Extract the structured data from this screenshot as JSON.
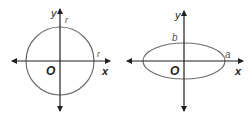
{
  "diagrams": [
    {
      "shape": "circle",
      "labels": {
        "y_axis": "y",
        "x_axis": "x",
        "origin": "O",
        "vertical_radius": "r",
        "horizontal_radius": "r"
      }
    },
    {
      "shape": "ellipse",
      "labels": {
        "y_axis": "y",
        "x_axis": "x",
        "origin": "O",
        "semi_minor": "b",
        "semi_major": "a"
      }
    }
  ],
  "colors": {
    "axis": "#231f20",
    "curve": "#6d6e71"
  }
}
